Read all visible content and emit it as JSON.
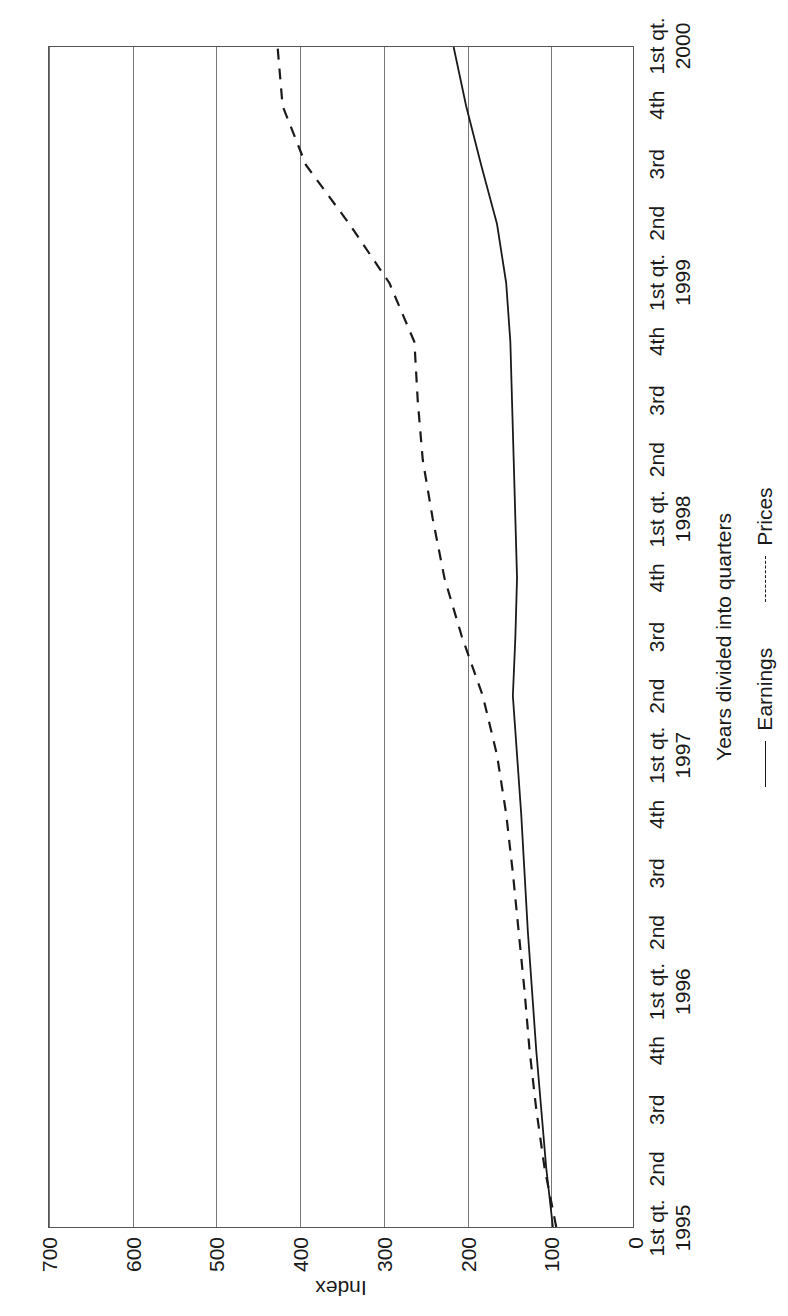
{
  "chart_data": {
    "type": "line",
    "title": "",
    "xlabel": "Years divided into quarters",
    "ylabel": "Index",
    "ylim": [
      0,
      700
    ],
    "yticks": [
      0,
      100,
      200,
      300,
      400,
      500,
      600,
      700
    ],
    "grid": true,
    "legend_position": "bottom",
    "orientation": "rotated-90-ccw",
    "categories": [
      "1995 1st qt.",
      "1995 2nd",
      "1995 3rd",
      "1995 4th",
      "1996 1st qt.",
      "1996 2nd",
      "1996 3rd",
      "1996 4th",
      "1997 1st qt.",
      "1997 2nd",
      "1997 3rd",
      "1997 4th",
      "1998 1st qt.",
      "1998 2nd",
      "1998 3rd",
      "1998 4th",
      "1999 1st qt.",
      "1999 2nd",
      "1999 3rd",
      "1999 4th",
      "2000 1st qt."
    ],
    "tick_labels": [
      {
        "quarter": "1st qt.",
        "year": "1995"
      },
      {
        "quarter": "2nd",
        "year": ""
      },
      {
        "quarter": "3rd",
        "year": ""
      },
      {
        "quarter": "4th",
        "year": ""
      },
      {
        "quarter": "1st qt.",
        "year": "1996"
      },
      {
        "quarter": "2nd",
        "year": ""
      },
      {
        "quarter": "3rd",
        "year": ""
      },
      {
        "quarter": "4th",
        "year": ""
      },
      {
        "quarter": "1st qt.",
        "year": "1997"
      },
      {
        "quarter": "2nd",
        "year": ""
      },
      {
        "quarter": "3rd",
        "year": ""
      },
      {
        "quarter": "4th",
        "year": ""
      },
      {
        "quarter": "1st qt.",
        "year": "1998"
      },
      {
        "quarter": "2nd",
        "year": ""
      },
      {
        "quarter": "3rd",
        "year": ""
      },
      {
        "quarter": "4th",
        "year": ""
      },
      {
        "quarter": "1st qt.",
        "year": "1999"
      },
      {
        "quarter": "2nd",
        "year": ""
      },
      {
        "quarter": "3rd",
        "year": ""
      },
      {
        "quarter": "4th",
        "year": ""
      },
      {
        "quarter": "1st qt.",
        "year": "2000"
      }
    ],
    "series": [
      {
        "name": "Earnings",
        "style": "solid",
        "color": "#1a1a1a",
        "values": [
          96,
          104,
          110,
          116,
          121,
          126,
          130,
          134,
          139,
          144,
          141,
          139,
          141,
          143,
          145,
          147,
          152,
          163,
          182,
          200,
          215
        ]
      },
      {
        "name": "Prices",
        "style": "dashed",
        "color": "#1a1a1a",
        "values": [
          92,
          106,
          116,
          124,
          130,
          137,
          144,
          152,
          163,
          180,
          205,
          226,
          240,
          252,
          258,
          262,
          292,
          340,
          392,
          420,
          426
        ]
      }
    ],
    "series_extra": {
      "prices_tail": [
        426,
        430,
        480,
        520,
        560,
        585,
        600,
        620
      ],
      "note": "after 1999 2nd quarter the Prices line continues rising to about 620"
    }
  },
  "axis": {
    "y_title": "Index",
    "x_title": "Years divided into quarters"
  },
  "legend": {
    "items": [
      {
        "label": "Earnings",
        "style": "solid"
      },
      {
        "label": "Prices",
        "style": "dashed"
      }
    ]
  }
}
